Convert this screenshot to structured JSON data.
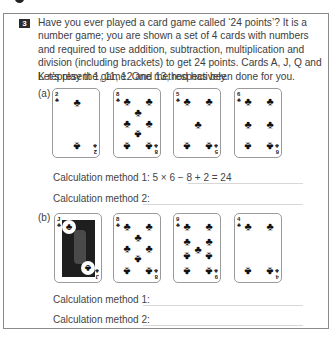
{
  "question": {
    "number": "3",
    "intro": "Have you ever played a card game called ‘24 points’? It is a number game; you are shown a set of 4 cards with numbers and required to use addition, subtraction, multiplication and division (including brackets) to get 24 points. Cards A, J, Q and K represent 1, 11, 12 and 13, respectively.",
    "lead": "Let’s play the game. One method has been done for you."
  },
  "parts": [
    {
      "label": "(a)",
      "cards": [
        {
          "rank": "2",
          "suit": "clubs",
          "suit_symbol": "♣"
        },
        {
          "rank": "8",
          "suit": "clubs",
          "suit_symbol": "♣"
        },
        {
          "rank": "5",
          "suit": "clubs",
          "suit_symbol": "♣"
        },
        {
          "rank": "6",
          "suit": "clubs",
          "suit_symbol": "♣"
        }
      ],
      "methods": [
        {
          "label": "Calculation method 1:",
          "answer": "5 × 6 − 8 + 2 = 24"
        },
        {
          "label": "Calculation method 2:",
          "answer": ""
        }
      ]
    },
    {
      "label": "(b)",
      "cards": [
        {
          "rank": "J",
          "suit": "clubs",
          "suit_symbol": "♣"
        },
        {
          "rank": "8",
          "suit": "clubs",
          "suit_symbol": "♣"
        },
        {
          "rank": "9",
          "suit": "clubs",
          "suit_symbol": "♣"
        },
        {
          "rank": "4",
          "suit": "clubs",
          "suit_symbol": "♣"
        }
      ],
      "methods": [
        {
          "label": "Calculation method 1:",
          "answer": ""
        },
        {
          "label": "Calculation method 2:",
          "answer": ""
        }
      ]
    }
  ]
}
